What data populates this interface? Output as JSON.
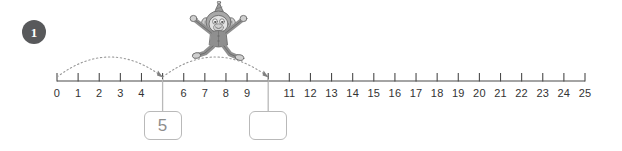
{
  "question": {
    "number": "1",
    "badge_color": "#58595b"
  },
  "illustration": {
    "name": "monkey-character",
    "description": "cartoon monkey wearing a party hat jumping above the number line",
    "colors": {
      "body": "#8c8c8c",
      "face": "#d9d9d9",
      "hat": "#9a9a9a",
      "outline": "#6b6b6b"
    }
  },
  "number_line": {
    "min": 0,
    "max": 25,
    "line_color": "#4a4a4a",
    "tick_labels": [
      "0",
      "1",
      "2",
      "3",
      "4",
      "5",
      "6",
      "7",
      "8",
      "9",
      "10",
      "11",
      "12",
      "13",
      "14",
      "15",
      "16",
      "17",
      "18",
      "19",
      "20",
      "21",
      "22",
      "23",
      "24",
      "25"
    ],
    "hidden_labels": [
      "5",
      "10"
    ]
  },
  "jumps": [
    {
      "name": "jump-1",
      "from": 0,
      "to": 5,
      "style": "dotted-arc",
      "arrow": true
    },
    {
      "name": "jump-2",
      "from": 5,
      "to": 10,
      "style": "dotted-arc",
      "arrow": true
    }
  ],
  "answer_boxes": [
    {
      "name": "answer-box-1",
      "at": 5,
      "value": "5",
      "filled": true
    },
    {
      "name": "answer-box-2",
      "at": 10,
      "value": "",
      "filled": false
    }
  ],
  "style": {
    "arc_color": "#9a9a9a",
    "box_border": "#b9b9b9",
    "answer_text": "#8d8d8d",
    "label_color": "#333333"
  }
}
